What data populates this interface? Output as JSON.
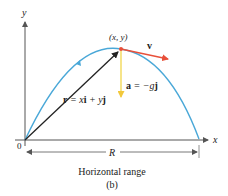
{
  "diagram": {
    "axes": {
      "x_label": "x",
      "y_label": "y",
      "origin_label": "0",
      "axis_color": "#555555"
    },
    "trajectory": {
      "color": "#4aa8d8",
      "start": [
        25,
        140
      ],
      "peak": [
        121,
        49
      ],
      "end": [
        199,
        139
      ]
    },
    "point": {
      "label": "(x, y)",
      "color": "#e8503a"
    },
    "velocity": {
      "label": "v",
      "color": "#e8503a"
    },
    "acceleration": {
      "label_a": "a",
      "label_eq": " = −g",
      "label_j": "j",
      "color": "#f2d64b"
    },
    "position": {
      "label_r": "r",
      "label_eq1": " = x",
      "label_i": "i",
      "label_eq2": " + y",
      "label_j": "j",
      "color": "#222222"
    },
    "range": {
      "label": "R",
      "caption": "Horizontal range",
      "color": "#555555"
    },
    "subfigure_label": "(b)"
  }
}
